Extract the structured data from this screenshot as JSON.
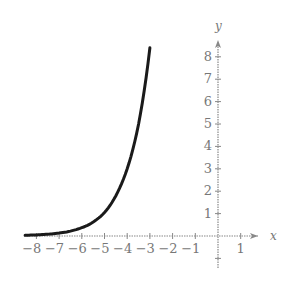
{
  "chart_data": {
    "type": "line",
    "title": "",
    "xlabel": "x",
    "ylabel": "y",
    "xlim": [
      -8.5,
      1.8
    ],
    "ylim": [
      -1.2,
      9
    ],
    "grid": false,
    "x_ticks": [
      -8,
      -7,
      -6,
      -5,
      -4,
      -3,
      -2,
      -1,
      1
    ],
    "y_ticks": [
      1,
      2,
      3,
      4,
      5,
      6,
      7,
      8
    ],
    "series": [
      {
        "name": "curve",
        "x": [
          -8.5,
          -8,
          -7.5,
          -7,
          -6.5,
          -6,
          -5.5,
          -5,
          -4.5,
          -4,
          -3.5,
          -3
        ],
        "y": [
          0.03,
          0.05,
          0.08,
          0.13,
          0.22,
          0.37,
          0.62,
          1.05,
          1.8,
          3.0,
          5.0,
          8.4
        ]
      }
    ],
    "color": "#1a1a1a",
    "axis_color": "#888888"
  },
  "axes": {
    "x_label": "x",
    "y_label": "y",
    "x_tick_labels": [
      "−8",
      "−7",
      "−6",
      "−5",
      "−4",
      "−3",
      "−2",
      "−1",
      "1"
    ],
    "y_tick_labels": [
      "1",
      "2",
      "3",
      "4",
      "5",
      "6",
      "7",
      "8"
    ]
  }
}
